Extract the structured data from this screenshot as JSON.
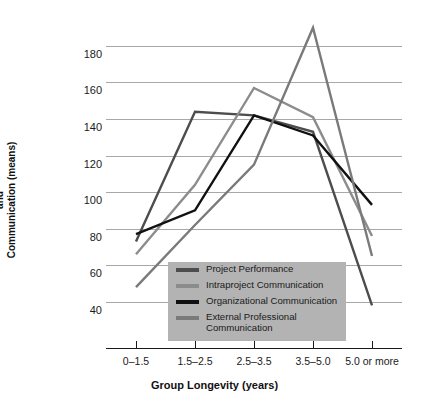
{
  "chart_data": {
    "type": "line",
    "title": "",
    "xlabel": "Group Longevity (years)",
    "ylabel": "Standardized Performance and Communication (means)",
    "ylabel_lines": [
      "Standardized Performance",
      "and",
      "Communication (means)"
    ],
    "categories": [
      "0–1.5",
      "1.5–2.5",
      "2.5–3.5",
      "3.5–5.0",
      "5.0 or more"
    ],
    "ylim": [
      30,
      192
    ],
    "yticks": [
      180,
      160,
      140,
      120,
      100,
      80,
      60,
      40
    ],
    "grid": true,
    "legend_position": "inside-bottom-left",
    "series": [
      {
        "name": "Project Performance",
        "color": "#4d4d4d",
        "values": [
          73,
          144,
          142,
          133,
          38
        ]
      },
      {
        "name": "Intraproject Communication",
        "color": "#8c8c8c",
        "values": [
          66,
          104,
          157,
          141,
          76
        ]
      },
      {
        "name": "Organizational Communication",
        "color": "#111111",
        "values": [
          77,
          90,
          142,
          131,
          93
        ]
      },
      {
        "name": "External Professional Communication",
        "color": "#7a7a7a",
        "values": [
          48,
          82,
          115,
          190,
          65
        ]
      }
    ]
  },
  "legend": {
    "background": "#b3b3b3",
    "entries": [
      {
        "label": "Project Performance",
        "color": "#4d4d4d"
      },
      {
        "label": "Intraproject Communication",
        "color": "#8c8c8c"
      },
      {
        "label": "Organizational Communication",
        "color": "#111111"
      },
      {
        "label": "External Professional\nCommunication",
        "color": "#7a7a7a"
      }
    ]
  },
  "axes": {
    "grid_color": "#a8a8a8",
    "axis_color": "#1a1a1a"
  }
}
